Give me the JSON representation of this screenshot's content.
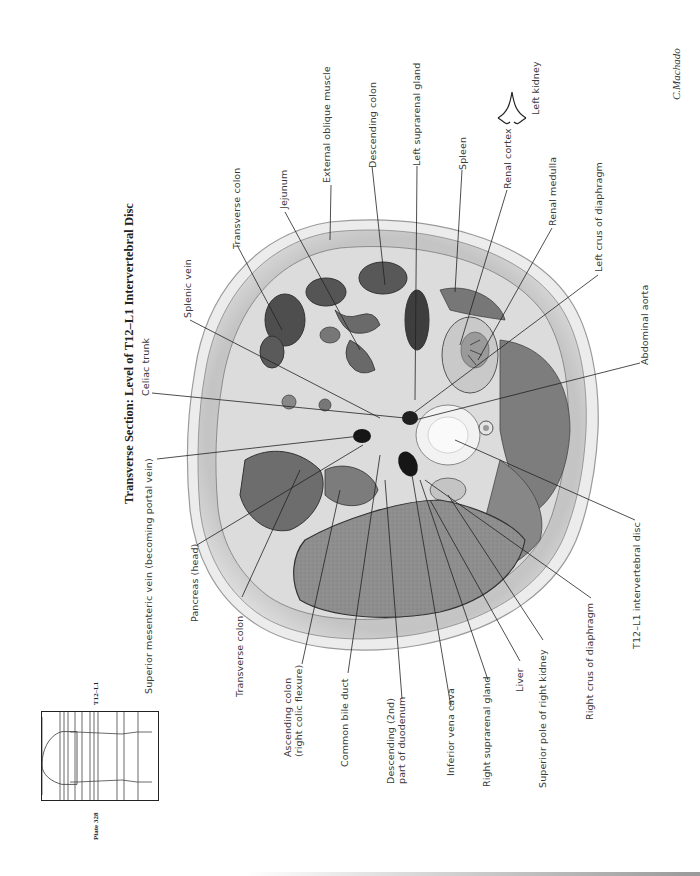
{
  "header": {
    "title": "Transverse Section: Level of T12–L1 Intervertebral Disc",
    "plate": "Plate 328",
    "level": "T12–L1",
    "signature": "C.Machado"
  },
  "labels": {
    "transverse_colon_top": "Transverse colon",
    "jejunum": "Jejunum",
    "external_oblique": "External oblique muscle",
    "descending_colon": "Descending colon",
    "left_suprarenal": "Left suprarenal gland",
    "spleen": "Spleen",
    "renal_cortex": "Renal cortex",
    "left_kidney": "Left kidney",
    "renal_medulla": "Renal medulla",
    "left_crus": "Left crus of diaphragm",
    "splenic_vein": "Splenic vein",
    "celiac_trunk": "Celiac trunk",
    "abdominal_aorta": "Abdominal aorta",
    "superior_mesenteric_vein": "Superior mesenteric vein (becoming portal vein)",
    "pancreas_head": "Pancreas (head)",
    "transverse_colon_bottom": "Transverse colon",
    "ascending_colon": "Ascending colon\n(right colic flexure)",
    "common_bile_duct": "Common bile duct",
    "descending_duodenum": "Descending (2nd)\npart of duodenum",
    "inferior_vena_cava": "Inferior vena cava",
    "right_suprarenal": "Right suprarenal gland",
    "liver": "Liver",
    "superior_pole_right_kidney": "Superior pole of right kidney",
    "right_crus": "Right crus of diaphragm",
    "intervertebral_disc": "T12–L1 intervertebral disc"
  },
  "colors": {
    "outline": "#222222",
    "tissue_light": "#e6e6e6",
    "tissue_mid": "#b8b8b8",
    "tissue_dark": "#5a5a5a",
    "liver": "#8c8c8c",
    "vessel": "#1a1a1a"
  }
}
